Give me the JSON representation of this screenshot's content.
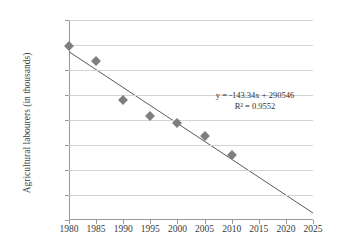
{
  "chart_data": {
    "type": "scatter",
    "title": "",
    "xlabel": "",
    "ylabel": "Agricultural labourers (in thousands)",
    "xlim": [
      1980,
      2025
    ],
    "ylim": [
      0,
      8000
    ],
    "grid": true,
    "legend": false,
    "x": [
      1980,
      1985,
      1990,
      1995,
      2000,
      2005,
      2010
    ],
    "values": [
      6980,
      6350,
      4800,
      4150,
      3900,
      3350,
      2600
    ],
    "series": [
      {
        "name": "Agricultural labourers",
        "x": [
          1980,
          1985,
          1990,
          1995,
          2000,
          2005,
          2010
        ],
        "values": [
          6980,
          6350,
          4800,
          4150,
          3900,
          3350,
          2600
        ]
      }
    ],
    "xticks": [
      1980,
      1985,
      1990,
      1995,
      2000,
      2005,
      2010,
      2015,
      2020,
      2025
    ],
    "xtick_labels": [
      "1980",
      "1985",
      "1990",
      "1995",
      "2000",
      "2005",
      "2010",
      "2015",
      "2020",
      "2025"
    ],
    "yticks": [
      0,
      1000,
      2000,
      3000,
      4000,
      5000,
      6000,
      7000,
      8000
    ],
    "ytick_labels": [
      "0",
      "1,000",
      "2,000",
      "3,000",
      "4,000",
      "5,000",
      "6,000",
      "7,000",
      "8,000"
    ],
    "trendline": {
      "type": "linear",
      "slope": -143.34,
      "intercept": 290546,
      "r_squared": 0.9552,
      "equation_label": "y = -143.34x + 290546",
      "r2_label": "R² = 0.9552",
      "x_start": 1980,
      "x_end": 2025,
      "y_start": 6730,
      "y_end": 280
    },
    "colors": {
      "marker": "#7f7f7f",
      "trendline": "#595959",
      "gridline": "#d4d4d4",
      "axis": "#9a9a9a",
      "text": "#3a3a3a"
    }
  }
}
